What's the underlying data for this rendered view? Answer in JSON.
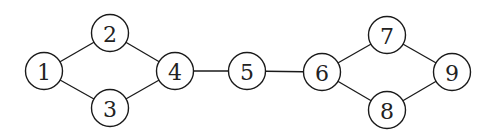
{
  "diagram": {
    "type": "undirected-graph",
    "colors": {
      "stroke": "#1a1a1a",
      "fill": "#ffffff",
      "label": "#222222"
    },
    "node_radius": 18.5,
    "nodes": [
      {
        "id": "1",
        "label": "1",
        "x": 44,
        "y": 71
      },
      {
        "id": "2",
        "label": "2",
        "x": 110,
        "y": 33
      },
      {
        "id": "3",
        "label": "3",
        "x": 110,
        "y": 108
      },
      {
        "id": "4",
        "label": "4",
        "x": 175,
        "y": 71
      },
      {
        "id": "5",
        "label": "5",
        "x": 247,
        "y": 71
      },
      {
        "id": "6",
        "label": "6",
        "x": 322,
        "y": 72
      },
      {
        "id": "7",
        "label": "7",
        "x": 387,
        "y": 35
      },
      {
        "id": "8",
        "label": "8",
        "x": 387,
        "y": 110
      },
      {
        "id": "9",
        "label": "9",
        "x": 452,
        "y": 72
      }
    ],
    "edges": [
      {
        "from": "1",
        "to": "2"
      },
      {
        "from": "1",
        "to": "3"
      },
      {
        "from": "2",
        "to": "4"
      },
      {
        "from": "3",
        "to": "4"
      },
      {
        "from": "4",
        "to": "5"
      },
      {
        "from": "5",
        "to": "6"
      },
      {
        "from": "6",
        "to": "7"
      },
      {
        "from": "6",
        "to": "8"
      },
      {
        "from": "7",
        "to": "9"
      },
      {
        "from": "8",
        "to": "9"
      }
    ]
  }
}
